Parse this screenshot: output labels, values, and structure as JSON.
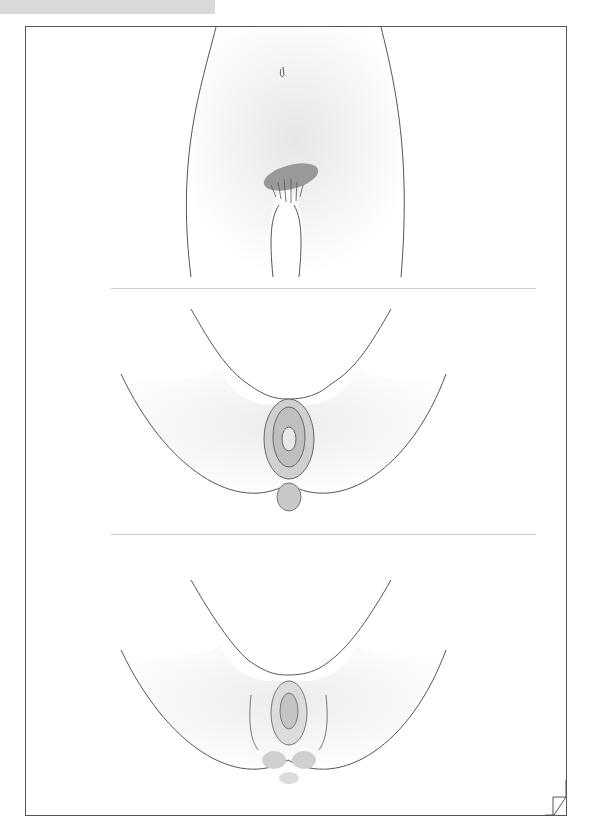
{
  "figure": {
    "type": "anatomical-illustration",
    "panels": [
      {
        "id": "front-view",
        "description": "Front view of lower torso with pubic region highlighted"
      },
      {
        "id": "perineal-view-1",
        "description": "Perineal view showing vulvar anatomy with detailed structures"
      },
      {
        "id": "perineal-view-2",
        "description": "Perineal view showing vulvar anatomy, simplified"
      }
    ],
    "colors": {
      "line": "#555555",
      "shade": "#d8d8d8",
      "highlight": "#999999",
      "divider": "#cfcfcf"
    }
  }
}
